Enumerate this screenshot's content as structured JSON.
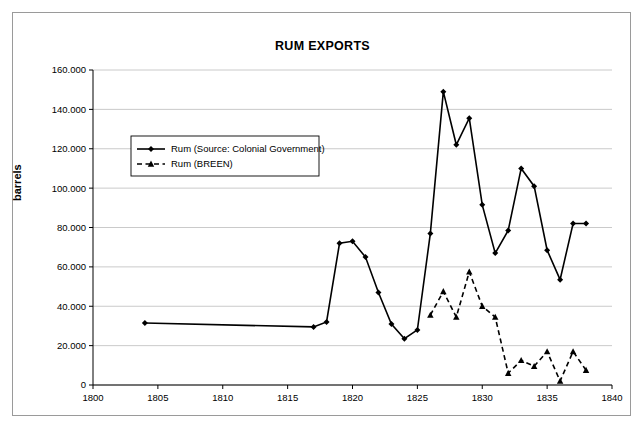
{
  "chart_data": {
    "type": "line",
    "title": "RUM EXPORTS",
    "xlabel": "",
    "ylabel": "barrels",
    "xlim": [
      1800,
      1840
    ],
    "ylim": [
      0,
      160000
    ],
    "xticks": [
      1800,
      1805,
      1810,
      1815,
      1820,
      1825,
      1830,
      1835,
      1840
    ],
    "yticks": [
      0,
      20000,
      40000,
      60000,
      80000,
      100000,
      120000,
      140000,
      160000
    ],
    "ytick_labels": [
      "0",
      "20.000",
      "40.000",
      "60.000",
      "80.000",
      "100.000",
      "120.000",
      "140.000",
      "160.000"
    ],
    "xtick_labels": [
      "1800",
      "1805",
      "1810",
      "1815",
      "1820",
      "1825",
      "1830",
      "1835",
      "1840"
    ],
    "grid": "horizontal",
    "legend_position": "upper-left-inside",
    "series": [
      {
        "name": "Rum (Source: Colonial Government)",
        "marker": "diamond",
        "linestyle": "solid",
        "color": "#000000",
        "x": [
          1804,
          1817,
          1818,
          1819,
          1820,
          1821,
          1822,
          1823,
          1824,
          1825,
          1826,
          1827,
          1828,
          1829,
          1830,
          1831,
          1832,
          1833,
          1834,
          1835,
          1836,
          1837,
          1838
        ],
        "y": [
          31500,
          29500,
          32000,
          72000,
          73000,
          65000,
          47000,
          31000,
          23500,
          28000,
          77000,
          149000,
          122000,
          135500,
          91500,
          67000,
          78500,
          110000,
          101000,
          68500,
          53500,
          82000,
          82000
        ]
      },
      {
        "name": "Rum (BREEN)",
        "marker": "triangle",
        "linestyle": "dashed",
        "color": "#000000",
        "x": [
          1826,
          1827,
          1828,
          1829,
          1830,
          1831,
          1832,
          1833,
          1834,
          1835,
          1836,
          1837,
          1838
        ],
        "y": [
          35500,
          47500,
          34500,
          57500,
          40000,
          34500,
          6000,
          12500,
          9500,
          17000,
          2000,
          17000,
          7500
        ]
      }
    ]
  },
  "legend": {
    "entries": [
      "Rum (Source: Colonial Government)",
      "Rum (BREEN)"
    ]
  }
}
